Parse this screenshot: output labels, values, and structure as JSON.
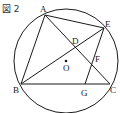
{
  "figure": {
    "title": "図 2",
    "colors": {
      "stroke": "#1a1a1a",
      "text": "#222222",
      "background": "#ffffff"
    },
    "circle": {
      "center_label": "O"
    },
    "points": {
      "A": "A",
      "B": "B",
      "C": "C",
      "D": "D",
      "E": "E",
      "F": "F",
      "G": "G",
      "O": "O"
    },
    "segments": [
      "AB",
      "AC",
      "AE",
      "BE",
      "BC",
      "EG"
    ]
  }
}
